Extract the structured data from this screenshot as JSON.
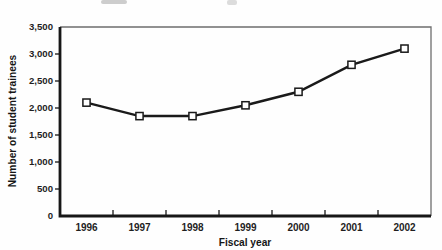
{
  "page": {
    "background": "#fefefe",
    "ink_color": "#1a1a1a",
    "frame_color": "#6e6e6e",
    "marker_fill": "#ffffff"
  },
  "chart": {
    "y_axis_title": "Number of student trainees",
    "x_axis_title": "Fiscal year"
  },
  "chart_data": {
    "type": "line",
    "title": "",
    "xlabel": "Fiscal year",
    "ylabel": "Number of student trainees",
    "categories": [
      "1996",
      "1997",
      "1998",
      "1999",
      "2000",
      "2001",
      "2002"
    ],
    "series": [
      {
        "name": "Number of student trainees",
        "values": [
          2100,
          1850,
          1850,
          2050,
          2300,
          2800,
          3100
        ],
        "color": "#1a1a1a",
        "marker": "open-square"
      }
    ],
    "ylim": [
      0,
      3500
    ],
    "y_ticks": [
      0,
      500,
      1000,
      1500,
      2000,
      2500,
      3000,
      3500
    ],
    "y_tick_labels": [
      "0",
      "500",
      "1,000",
      "1,500",
      "2,000",
      "2,500",
      "3,000",
      "3,500"
    ],
    "grid": false,
    "legend": "none"
  }
}
